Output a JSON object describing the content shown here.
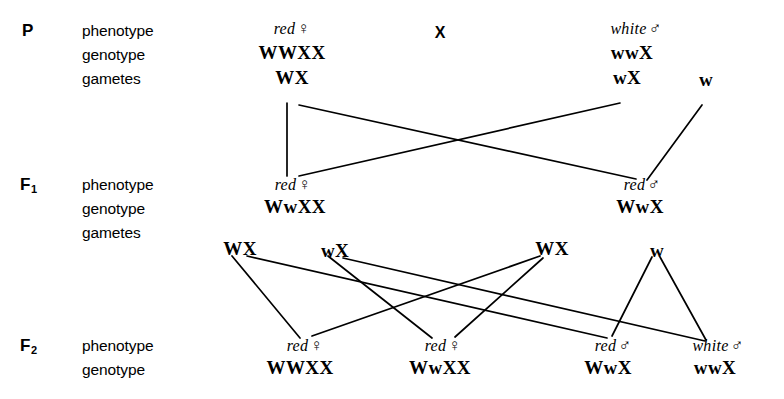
{
  "diagram": {
    "type": "genetic-cross-pedigree",
    "cross_symbol": "X",
    "row_terms": {
      "phenotype": "phenotype",
      "genotype": "genotype",
      "gametes": "gametes"
    },
    "generations": [
      {
        "id": "P",
        "label": "P",
        "label_main": "P",
        "label_sub": "",
        "terms": [
          "phenotype",
          "genotype",
          "gametes"
        ],
        "individuals": [
          {
            "id": "p-female",
            "phenotype": "red",
            "sex": "♀",
            "genotype": "WWXX",
            "gametes": [
              "WX"
            ]
          },
          {
            "id": "p-male",
            "phenotype": "white",
            "sex": "♂",
            "genotype": "wwX",
            "gametes": [
              "wX",
              "w"
            ]
          }
        ]
      },
      {
        "id": "F1",
        "label": "F1",
        "label_main": "F",
        "label_sub": "1",
        "terms": [
          "phenotype",
          "genotype",
          "gametes"
        ],
        "individuals": [
          {
            "id": "f1-female",
            "phenotype": "red",
            "sex": "♀",
            "genotype": "WwXX",
            "gametes": [
              "WX",
              "wX"
            ]
          },
          {
            "id": "f1-male",
            "phenotype": "red",
            "sex": "♂",
            "genotype": "WwX",
            "gametes": [
              "WX",
              "w"
            ]
          }
        ]
      },
      {
        "id": "F2",
        "label": "F2",
        "label_main": "F",
        "label_sub": "2",
        "terms": [
          "phenotype",
          "genotype"
        ],
        "individuals": [
          {
            "id": "f2-1",
            "phenotype": "red",
            "sex": "♀",
            "genotype": "WWXX"
          },
          {
            "id": "f2-2",
            "phenotype": "red",
            "sex": "♀",
            "genotype": "WwXX"
          },
          {
            "id": "f2-3",
            "phenotype": "red",
            "sex": "♂",
            "genotype": "WwX"
          },
          {
            "id": "f2-4",
            "phenotype": "white",
            "sex": "♂",
            "genotype": "wwX"
          }
        ]
      }
    ]
  },
  "labels": {
    "p_gen": "P",
    "f1_main": "F",
    "f1_sub": "1",
    "f2_main": "F",
    "f2_sub": "2",
    "phenotype": "phenotype",
    "genotype": "genotype",
    "gametes": "gametes",
    "cross": "X"
  },
  "p_row": {
    "female_pheno": "red",
    "female_sex": "♀",
    "female_geno": "WWXX",
    "female_gamete": "WX",
    "male_pheno": "white",
    "male_sex": "♂",
    "male_geno": "wwX",
    "male_gamete_1": "wX",
    "male_gamete_2": "w"
  },
  "f1_row": {
    "female_pheno": "red",
    "female_sex": "♀",
    "female_geno": "WwXX",
    "female_gamete_1": "WX",
    "female_gamete_2": "wX",
    "male_pheno": "red",
    "male_sex": "♂",
    "male_geno": "WwX",
    "male_gamete_1": "WX",
    "male_gamete_2": "w"
  },
  "f2_row": {
    "o1_pheno": "red",
    "o1_sex": "♀",
    "o1_geno": "WWXX",
    "o2_pheno": "red",
    "o2_sex": "♀",
    "o2_geno": "WwXX",
    "o3_pheno": "red",
    "o3_sex": "♂",
    "o3_geno": "WwX",
    "o4_pheno": "white",
    "o4_sex": "♂",
    "o4_geno": "wwX"
  },
  "style": {
    "ink": "#000000",
    "paper": "#ffffff",
    "line_width": 1.7
  }
}
